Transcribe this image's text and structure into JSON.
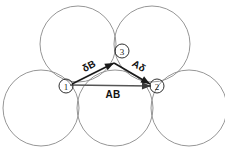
{
  "figure": {
    "background_color": "#ffffff",
    "circle_stroke_color": "#8a8a8a",
    "vector_color": "#1a1a1a",
    "base_vector_color": "#555555",
    "width": 225,
    "height": 148
  },
  "circles": [
    {
      "id": "top-left-circle",
      "label": "top left circle",
      "cx": 78,
      "cy": 44,
      "r": 38
    },
    {
      "id": "top-right-circle",
      "label": "top right circle",
      "cx": 152,
      "cy": 44,
      "r": 38
    },
    {
      "id": "bottom-left-circle",
      "label": "bottom left circle",
      "cx": 41,
      "cy": 108,
      "r": 38
    },
    {
      "id": "bottom-center-circle",
      "label": "bottom center circle",
      "cx": 115,
      "cy": 108,
      "r": 38
    },
    {
      "id": "bottom-right-circle",
      "label": "bottom right circle",
      "cx": 189,
      "cy": 108,
      "r": 38
    }
  ],
  "markers": [
    {
      "id": "marker-1",
      "text": "1",
      "cx": 66,
      "cy": 86,
      "r": 7
    },
    {
      "id": "marker-2",
      "text": "2",
      "cx": 157,
      "cy": 86,
      "r": 7
    },
    {
      "id": "marker-3",
      "text": "3",
      "cx": 122,
      "cy": 51,
      "r": 7
    }
  ],
  "vectors": [
    {
      "id": "vector-delta-b",
      "label": "δB",
      "from": "1",
      "to": "3",
      "x1": 72,
      "y1": 84,
      "x2": 114,
      "y2": 63,
      "label_x": 89,
      "label_y": 66,
      "label_rotation": -28
    },
    {
      "id": "vector-a-delta",
      "label": "Aδ",
      "from": "3",
      "to": "2",
      "x1": 114,
      "y1": 63,
      "x2": 150,
      "y2": 84,
      "label_x": 139,
      "label_y": 66,
      "label_rotation": 30
    },
    {
      "id": "vector-ab",
      "label": "AB",
      "from": "1",
      "to": "2",
      "x1": 70,
      "y1": 85,
      "x2": 151,
      "y2": 86,
      "label_x": 113,
      "label_y": 94,
      "label_rotation": 0
    }
  ]
}
